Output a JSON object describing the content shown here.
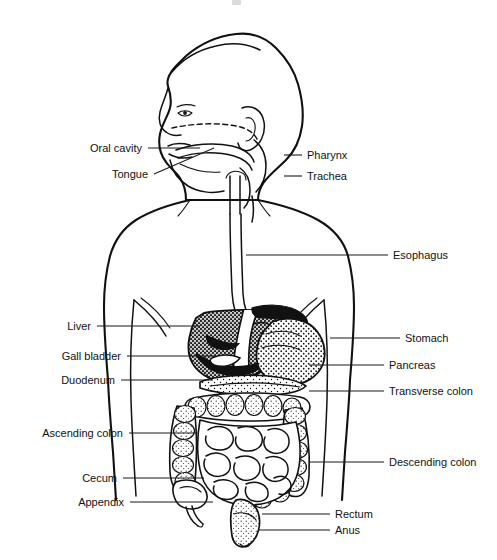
{
  "diagram": {
    "view": "anterior body outline with lateral head profile",
    "style": "black-and-white line drawing with stippled shading",
    "background_color": "#ffffff",
    "line_color": "#111111",
    "width": 497,
    "height": 560
  },
  "labels": {
    "left": [
      {
        "id": "oral-cavity",
        "text": "Oral cavity",
        "text_x": 142,
        "text_y": 152,
        "leader": "M148,148 L200,148"
      },
      {
        "id": "tongue",
        "text": "Tongue",
        "text_x": 148,
        "text_y": 178,
        "leader": "M154,174 L214,148"
      },
      {
        "id": "liver",
        "text": "Liver",
        "text_x": 91,
        "text_y": 330,
        "leader": "M97,326 L200,326"
      },
      {
        "id": "gall-bladder",
        "text": "Gall bladder",
        "text_x": 121,
        "text_y": 360,
        "leader": "M127,356 L214,356"
      },
      {
        "id": "duodenum",
        "text": "Duodenum",
        "text_x": 115,
        "text_y": 384,
        "leader": "M121,380 L213,380"
      },
      {
        "id": "ascending-colon",
        "text": "Ascending colon",
        "text_x": 123,
        "text_y": 437,
        "leader": "M129,433 L196,433"
      },
      {
        "id": "cecum",
        "text": "Cecum",
        "text_x": 117,
        "text_y": 482,
        "leader": "M123,478 L204,478"
      },
      {
        "id": "appendix",
        "text": "Appendix",
        "text_x": 124,
        "text_y": 506,
        "leader": "M130,502 L213,502"
      }
    ],
    "right": [
      {
        "id": "pharynx",
        "text": "Pharynx",
        "text_x": 307,
        "text_y": 159,
        "leader": "M284,155 L302,155"
      },
      {
        "id": "trachea",
        "text": "Trachea",
        "text_x": 307,
        "text_y": 180,
        "leader": "M284,176 L302,176"
      },
      {
        "id": "esophagus",
        "text": "Esophagus",
        "text_x": 393,
        "text_y": 259,
        "leader": "M246,255 L388,255"
      },
      {
        "id": "stomach",
        "text": "Stomach",
        "text_x": 405,
        "text_y": 342,
        "leader": "M330,338 L400,338"
      },
      {
        "id": "pancreas",
        "text": "Pancreas",
        "text_x": 389,
        "text_y": 369,
        "leader": "M309,365 L384,365"
      },
      {
        "id": "transverse-colon",
        "text": "Transverse colon",
        "text_x": 389,
        "text_y": 395,
        "leader": "M309,391 L384,391"
      },
      {
        "id": "descending-colon",
        "text": "Descending colon",
        "text_x": 389,
        "text_y": 466,
        "leader": "M309,462 L384,462"
      },
      {
        "id": "rectum",
        "text": "Rectum",
        "text_x": 335,
        "text_y": 518,
        "leader": "M262,514 L330,514"
      },
      {
        "id": "anus",
        "text": "Anus",
        "text_x": 335,
        "text_y": 534,
        "leader": "M258,530 L330,530"
      }
    ]
  }
}
